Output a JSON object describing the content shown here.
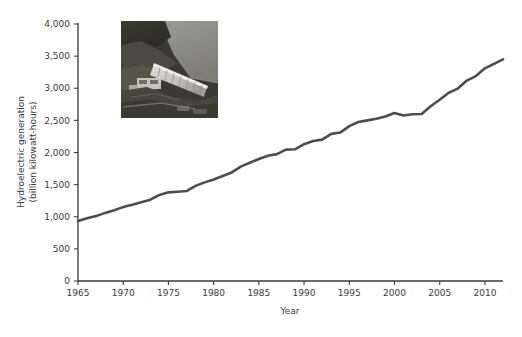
{
  "figure": {
    "background_color": "#ffffff",
    "line_color": "#4d4d4d",
    "axis_color": "#3a3a3a",
    "text_color": "#3a3a3a"
  },
  "inset_image": {
    "name": "hydroelectric-dam-photo",
    "description": "Aerial black-and-white photograph of a hydroelectric dam and reservoir",
    "left": 121,
    "top": 21,
    "width": 97,
    "height": 97
  },
  "chart_data": {
    "type": "line",
    "title": "",
    "xlabel": "Year",
    "ylabel": "Hydroelectric generation\n(billion kilowatt-hours)",
    "ylabel_line1": "Hydroelectric generation",
    "ylabel_line2": "(billion kilowatt-hours)",
    "xlim": [
      1965,
      2012
    ],
    "ylim": [
      0,
      4000
    ],
    "xticks": [
      1965,
      1970,
      1975,
      1980,
      1985,
      1990,
      1995,
      2000,
      2005,
      2010
    ],
    "xtick_labels": [
      "1965",
      "1970",
      "1975",
      "1980",
      "1985",
      "1990",
      "1995",
      "2000",
      "2005",
      "2010"
    ],
    "yticks": [
      0,
      500,
      1000,
      1500,
      2000,
      2500,
      3000,
      3500,
      4000
    ],
    "ytick_labels": [
      "0",
      "500",
      "1,000",
      "1,500",
      "2,000",
      "2,500",
      "3,000",
      "3,500",
      "4,000"
    ],
    "grid": false,
    "legend": false,
    "series": [
      {
        "name": "World hydroelectric generation",
        "color": "#4d4d4d",
        "x": [
          1965,
          1966,
          1967,
          1968,
          1969,
          1970,
          1971,
          1972,
          1973,
          1974,
          1975,
          1976,
          1977,
          1978,
          1979,
          1980,
          1981,
          1982,
          1983,
          1984,
          1985,
          1986,
          1987,
          1988,
          1989,
          1990,
          1991,
          1992,
          1993,
          1994,
          1995,
          1996,
          1997,
          1998,
          1999,
          2000,
          2001,
          2002,
          2003,
          2004,
          2005,
          2006,
          2007,
          2008,
          2009,
          2010,
          2011,
          2012
        ],
        "values": [
          933,
          975,
          1010,
          1060,
          1100,
          1150,
          1185,
          1225,
          1265,
          1340,
          1380,
          1390,
          1400,
          1480,
          1535,
          1580,
          1635,
          1690,
          1780,
          1840,
          1900,
          1950,
          1975,
          2045,
          2050,
          2130,
          2180,
          2200,
          2290,
          2310,
          2410,
          2475,
          2500,
          2525,
          2560,
          2615,
          2575,
          2595,
          2600,
          2720,
          2820,
          2930,
          2995,
          3120,
          3190,
          3310,
          3380,
          3450
        ]
      }
    ]
  }
}
